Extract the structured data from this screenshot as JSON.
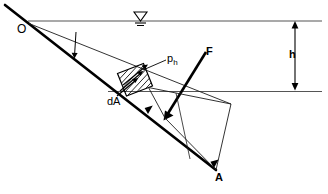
{
  "figure": {
    "labels": {
      "origin": "O",
      "pressure": "p",
      "pressure_subscript": "h",
      "element_area": "dA",
      "force": "F",
      "point_a": "A",
      "depth": "h"
    },
    "colors": {
      "line": "#000000",
      "thin_line": "#3a3a3a",
      "surface_line": "#555555",
      "background": "#ffffff"
    },
    "geometry": {
      "water_surface_y": 21,
      "lower_surface_y": 91,
      "origin": [
        28,
        23
      ],
      "point_a": [
        216,
        170
      ],
      "depth_dimension_x": 295,
      "depth_dimension_top": 22,
      "depth_dimension_bottom": 89
    },
    "annotations": {
      "water_surface_symbol": "inverted-triangle-with-hatch",
      "pressure_distribution": "hatched-parallelogram",
      "resultant_force_direction": "normal-to-plane-downward-left"
    }
  }
}
